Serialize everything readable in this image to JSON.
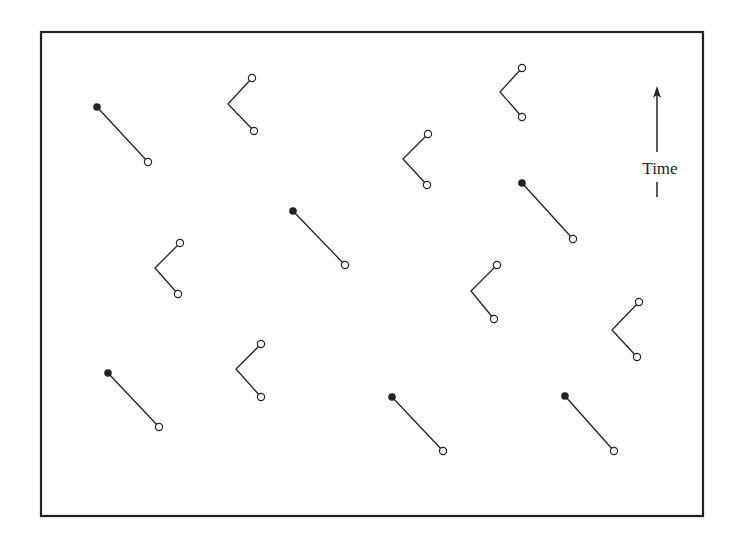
{
  "frame": {
    "x": 41,
    "y": 32,
    "width": 662,
    "height": 484,
    "stroke": "#222222"
  },
  "time_axis": {
    "label": "Time",
    "x": 657,
    "y_bottom": 197,
    "y_top": 86,
    "label_y": 174
  },
  "colors": {
    "ink": "#222222",
    "background": "#ffffff"
  },
  "segments": [
    {
      "from": [
        97,
        107
      ],
      "to": [
        148,
        162
      ]
    },
    {
      "from": [
        293,
        211
      ],
      "to": [
        345,
        265
      ]
    },
    {
      "from": [
        522,
        183
      ],
      "to": [
        573,
        239
      ]
    },
    {
      "from": [
        108,
        373
      ],
      "to": [
        159,
        427
      ]
    },
    {
      "from": [
        392,
        397
      ],
      "to": [
        443,
        451
      ]
    },
    {
      "from": [
        565,
        396
      ],
      "to": [
        614,
        451
      ]
    }
  ],
  "vees": [
    {
      "top": [
        252,
        78
      ],
      "vertex": [
        228,
        104
      ],
      "bottom": [
        254,
        131
      ]
    },
    {
      "top": [
        522,
        68
      ],
      "vertex": [
        500,
        92
      ],
      "bottom": [
        522,
        117
      ]
    },
    {
      "top": [
        428,
        134
      ],
      "vertex": [
        403,
        159
      ],
      "bottom": [
        427,
        185
      ]
    },
    {
      "top": [
        180,
        243
      ],
      "vertex": [
        155,
        268
      ],
      "bottom": [
        178,
        294
      ]
    },
    {
      "top": [
        497,
        265
      ],
      "vertex": [
        471,
        291
      ],
      "bottom": [
        494,
        319
      ]
    },
    {
      "top": [
        639,
        302
      ],
      "vertex": [
        612,
        330
      ],
      "bottom": [
        637,
        357
      ]
    },
    {
      "top": [
        261,
        344
      ],
      "vertex": [
        236,
        369
      ],
      "bottom": [
        261,
        397
      ]
    }
  ]
}
